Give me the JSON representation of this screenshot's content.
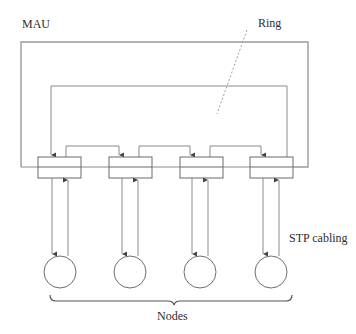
{
  "diagram": {
    "type": "Token Ring MAU topology",
    "labels": {
      "mau": "MAU",
      "ring": "Ring",
      "cabling": "STP cabling",
      "nodes": "Nodes"
    },
    "ports": [
      {
        "id": "port-1"
      },
      {
        "id": "port-2"
      },
      {
        "id": "port-3"
      },
      {
        "id": "port-4"
      }
    ],
    "nodes": [
      {
        "id": "node-1"
      },
      {
        "id": "node-2"
      },
      {
        "id": "node-3"
      },
      {
        "id": "node-4"
      }
    ],
    "colors": {
      "line": "#8a8a8a",
      "text": "#2e2e2e",
      "background": "#ffffff"
    }
  }
}
